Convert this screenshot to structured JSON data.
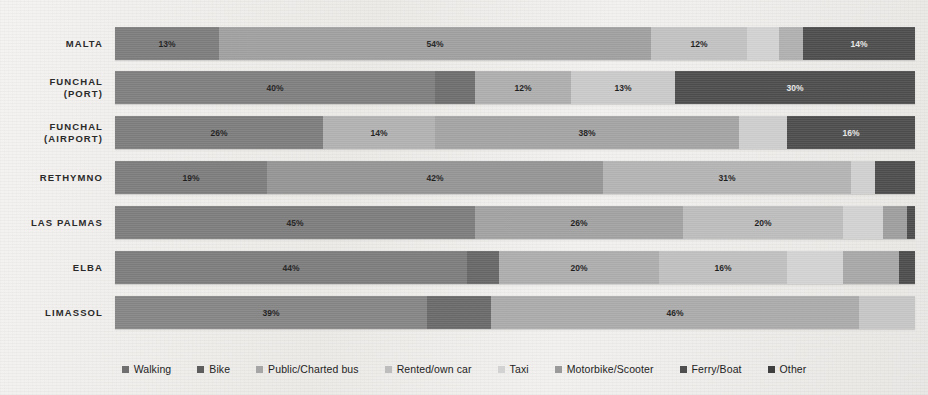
{
  "chart_data": {
    "type": "bar",
    "orientation": "horizontal",
    "stacked": true,
    "normalized_percent": true,
    "title": "",
    "xlabel": "",
    "ylabel": "",
    "xlim": [
      0,
      100
    ],
    "grid": false,
    "legend_position": "bottom",
    "categories": [
      "MALTA",
      "FUNCHAL (PORT)",
      "FUNCHAL (AIRPORT)",
      "RETHYMNO",
      "LAS PALMAS",
      "ELBA",
      "LIMASSOL"
    ],
    "series": [
      {
        "name": "Walking",
        "color": "#7d7d7d",
        "values": [
          13,
          0,
          26,
          19,
          45,
          0,
          39
        ]
      },
      {
        "name": "Bike",
        "color": "#8e8e8e",
        "values": [
          0,
          40,
          0,
          0,
          0,
          44,
          0
        ]
      },
      {
        "name": "Public/Charted bus",
        "color": "#a6a6a6",
        "values": [
          54,
          0,
          14,
          42,
          0,
          3,
          8
        ]
      },
      {
        "name": "Rented/own car",
        "color": "#b9b9b9",
        "values": [
          0,
          12,
          38,
          31,
          26,
          20,
          46
        ]
      },
      {
        "name": "Taxi",
        "color": "#cfcfcf",
        "values": [
          12,
          13,
          4,
          3,
          20,
          16,
          7
        ]
      },
      {
        "name": "Motorbike/Scooter",
        "color": "#9c9c9c",
        "values": [
          4,
          0,
          2,
          1,
          4,
          8,
          0
        ]
      },
      {
        "name": "Ferry/Boat",
        "color": "#5a5a5a",
        "values": [
          3,
          5,
          0,
          0,
          3,
          7,
          0
        ]
      },
      {
        "name": "Other",
        "color": "#4a4a4a",
        "values": [
          14,
          30,
          16,
          5,
          2,
          2,
          0
        ]
      }
    ],
    "rows": [
      {
        "label": "MALTA",
        "label_lines": [
          "MALTA"
        ],
        "segments": [
          {
            "series": "Walking",
            "value": 13,
            "label": "13%",
            "color": "#7d7d7d",
            "show_label": true,
            "dark": false
          },
          {
            "series": "Public/Charted bus",
            "value": 54,
            "label": "54%",
            "color": "#a0a0a0",
            "show_label": true,
            "dark": false
          },
          {
            "series": "Taxi",
            "value": 12,
            "label": "12%",
            "color": "#c2c2c2",
            "show_label": true,
            "dark": false
          },
          {
            "series": "Rented/own car",
            "value": 4,
            "label": "",
            "color": "#d2d2d2",
            "show_label": false,
            "dark": false
          },
          {
            "series": "Motorbike/Scooter",
            "value": 3,
            "label": "",
            "color": "#b0b0b0",
            "show_label": false,
            "dark": false
          },
          {
            "series": "Other",
            "value": 14,
            "label": "14%",
            "color": "#4d4d4d",
            "show_label": true,
            "dark": true
          }
        ]
      },
      {
        "label": "FUNCHAL (PORT)",
        "label_lines": [
          "FUNCHAL",
          "(PORT)"
        ],
        "segments": [
          {
            "series": "Bike",
            "value": 40,
            "label": "40%",
            "color": "#7f7f7f",
            "show_label": true,
            "dark": false
          },
          {
            "series": "Ferry/Boat",
            "value": 5,
            "label": "",
            "color": "#6e6e6e",
            "show_label": false,
            "dark": false
          },
          {
            "series": "Public/Charted bus",
            "value": 12,
            "label": "12%",
            "color": "#aeaeae",
            "show_label": true,
            "dark": false
          },
          {
            "series": "Rented/own car",
            "value": 13,
            "label": "13%",
            "color": "#cacaca",
            "show_label": true,
            "dark": false
          },
          {
            "series": "Other",
            "value": 30,
            "label": "30%",
            "color": "#4d4d4d",
            "show_label": true,
            "dark": true
          }
        ]
      },
      {
        "label": "FUNCHAL (AIRPORT)",
        "label_lines": [
          "FUNCHAL",
          "(AIRPORT)"
        ],
        "segments": [
          {
            "series": "Walking",
            "value": 26,
            "label": "26%",
            "color": "#7d7d7d",
            "show_label": true,
            "dark": false
          },
          {
            "series": "Public/Charted bus",
            "value": 14,
            "label": "14%",
            "color": "#b2b2b2",
            "show_label": true,
            "dark": false
          },
          {
            "series": "Rented/own car",
            "value": 38,
            "label": "38%",
            "color": "#a4a4a4",
            "show_label": true,
            "dark": false
          },
          {
            "series": "Taxi",
            "value": 6,
            "label": "",
            "color": "#cecece",
            "show_label": false,
            "dark": false
          },
          {
            "series": "Other",
            "value": 16,
            "label": "16%",
            "color": "#4d4d4d",
            "show_label": true,
            "dark": true
          }
        ]
      },
      {
        "label": "RETHYMNO",
        "label_lines": [
          "RETHYMNO"
        ],
        "segments": [
          {
            "series": "Walking",
            "value": 19,
            "label": "19%",
            "color": "#7d7d7d",
            "show_label": true,
            "dark": false
          },
          {
            "series": "Public/Charted bus",
            "value": 42,
            "label": "42%",
            "color": "#959595",
            "show_label": true,
            "dark": false
          },
          {
            "series": "Rented/own car",
            "value": 31,
            "label": "31%",
            "color": "#b4b4b4",
            "show_label": true,
            "dark": false
          },
          {
            "series": "Taxi",
            "value": 3,
            "label": "",
            "color": "#d0d0d0",
            "show_label": false,
            "dark": false
          },
          {
            "series": "Other",
            "value": 5,
            "label": "",
            "color": "#4d4d4d",
            "show_label": false,
            "dark": true
          }
        ]
      },
      {
        "label": "LAS PALMAS",
        "label_lines": [
          "LAS PALMAS"
        ],
        "segments": [
          {
            "series": "Walking",
            "value": 45,
            "label": "45%",
            "color": "#7d7d7d",
            "show_label": true,
            "dark": false
          },
          {
            "series": "Public/Charted bus",
            "value": 26,
            "label": "26%",
            "color": "#a2a2a2",
            "show_label": true,
            "dark": false
          },
          {
            "series": "Rented/own car",
            "value": 20,
            "label": "20%",
            "color": "#bdbdbd",
            "show_label": true,
            "dark": false
          },
          {
            "series": "Taxi",
            "value": 5,
            "label": "",
            "color": "#d2d2d2",
            "show_label": false,
            "dark": false
          },
          {
            "series": "Motorbike/Scooter",
            "value": 3,
            "label": "",
            "color": "#9e9e9e",
            "show_label": false,
            "dark": false
          },
          {
            "series": "Other",
            "value": 1,
            "label": "",
            "color": "#4d4d4d",
            "show_label": false,
            "dark": true
          }
        ]
      },
      {
        "label": "ELBA",
        "label_lines": [
          "ELBA"
        ],
        "segments": [
          {
            "series": "Bike",
            "value": 44,
            "label": "44%",
            "color": "#7d7d7d",
            "show_label": true,
            "dark": false
          },
          {
            "series": "Ferry/Boat",
            "value": 4,
            "label": "",
            "color": "#676767",
            "show_label": false,
            "dark": false
          },
          {
            "series": "Public/Charted bus",
            "value": 20,
            "label": "20%",
            "color": "#adadad",
            "show_label": true,
            "dark": false
          },
          {
            "series": "Rented/own car",
            "value": 16,
            "label": "16%",
            "color": "#c0c0c0",
            "show_label": true,
            "dark": false
          },
          {
            "series": "Taxi",
            "value": 7,
            "label": "",
            "color": "#d3d3d3",
            "show_label": false,
            "dark": false
          },
          {
            "series": "Motorbike/Scooter",
            "value": 7,
            "label": "",
            "color": "#a8a8a8",
            "show_label": false,
            "dark": false
          },
          {
            "series": "Other",
            "value": 2,
            "label": "",
            "color": "#4d4d4d",
            "show_label": false,
            "dark": true
          }
        ]
      },
      {
        "label": "LIMASSOL",
        "label_lines": [
          "LIMASSOL"
        ],
        "segments": [
          {
            "series": "Walking",
            "value": 39,
            "label": "39%",
            "color": "#858585",
            "show_label": true,
            "dark": false
          },
          {
            "series": "Ferry/Boat",
            "value": 8,
            "label": "",
            "color": "#6a6a6a",
            "show_label": false,
            "dark": false
          },
          {
            "series": "Public/Charted bus",
            "value": 46,
            "label": "46%",
            "color": "#ababab",
            "show_label": true,
            "dark": false
          },
          {
            "series": "Rented/own car",
            "value": 7,
            "label": "",
            "color": "#c6c6c6",
            "show_label": false,
            "dark": false
          }
        ]
      }
    ],
    "legend": [
      {
        "label": "Walking",
        "color": "#6f6f6f"
      },
      {
        "label": "Bike",
        "color": "#5d5d5d"
      },
      {
        "label": "Public/Charted bus",
        "color": "#a6a6a6"
      },
      {
        "label": "Rented/own car",
        "color": "#bdbdbd"
      },
      {
        "label": "Taxi",
        "color": "#d2d2d2"
      },
      {
        "label": "Motorbike/Scooter",
        "color": "#9a9a9a"
      },
      {
        "label": "Ferry/Boat",
        "color": "#4f4f4f"
      },
      {
        "label": "Other",
        "color": "#3f3f3f"
      }
    ]
  }
}
